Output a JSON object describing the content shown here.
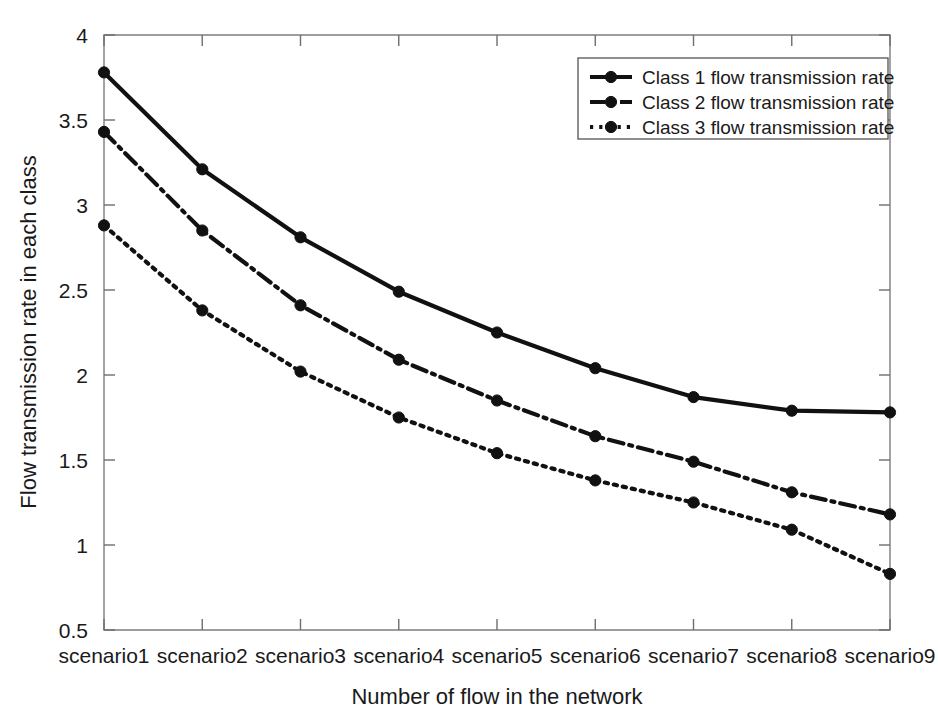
{
  "chart_data": {
    "type": "line",
    "title": "",
    "xlabel": "Number of flow in the network",
    "ylabel": "Flow transmission rate in each class",
    "categories": [
      "scenario1",
      "scenario2",
      "scenario3",
      "scenario4",
      "scenario5",
      "scenario6",
      "scenario7",
      "scenario8",
      "scenario9"
    ],
    "ylim": [
      0.5,
      4
    ],
    "yticks": [
      "0.5",
      "1",
      "1.5",
      "2",
      "2.5",
      "3",
      "3.5",
      "4"
    ],
    "ytick_values": [
      0.5,
      1,
      1.5,
      2,
      2.5,
      3,
      3.5,
      4
    ],
    "grid": false,
    "legend_position": "top-right",
    "series": [
      {
        "name": "Class 1 flow transmission rate",
        "style": "solid",
        "color": "#111111",
        "values": [
          3.78,
          3.21,
          2.81,
          2.49,
          2.25,
          2.04,
          1.87,
          1.79,
          1.78
        ]
      },
      {
        "name": "Class 2 flow transmission rate",
        "style": "dash-dot",
        "color": "#111111",
        "values": [
          3.43,
          2.85,
          2.41,
          2.09,
          1.85,
          1.64,
          1.49,
          1.31,
          1.18
        ]
      },
      {
        "name": "Class 3 flow transmission rate",
        "style": "dotted",
        "color": "#111111",
        "values": [
          2.88,
          2.38,
          2.02,
          1.75,
          1.54,
          1.38,
          1.25,
          1.09,
          0.83
        ]
      }
    ]
  },
  "legend": {
    "entries": [
      {
        "label": "Class 1 flow transmission rate"
      },
      {
        "label": "Class 2 flow transmission rate"
      },
      {
        "label": "Class 3 flow transmission rate"
      }
    ]
  }
}
